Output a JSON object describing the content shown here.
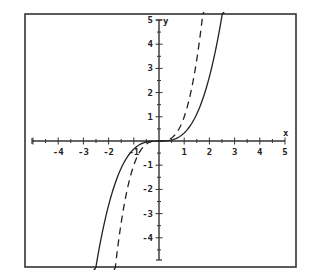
{
  "chart_data": {
    "type": "line",
    "title": "",
    "xlabel": "x",
    "ylabel": "y",
    "xlim": [
      -5,
      5
    ],
    "ylim": [
      -5,
      5
    ],
    "grid": false,
    "legend": null,
    "x_ticks": [
      -4,
      -3,
      -2,
      -1,
      1,
      2,
      3,
      4,
      5
    ],
    "x_tick_labels": [
      "-4",
      "-3",
      "-2",
      "-1",
      "1",
      "2",
      "3",
      "4",
      "5"
    ],
    "y_ticks": [
      -4,
      -3,
      -2,
      -1,
      1,
      2,
      3,
      4,
      5
    ],
    "y_tick_labels": [
      "-4",
      "-3",
      "-2",
      "-1",
      "1",
      "2",
      "3",
      "4",
      "5"
    ],
    "minor_tick_step": 0.5,
    "series": [
      {
        "name": "solid",
        "style": "solid",
        "color": "#222222",
        "expression": "y = x^3 / 3",
        "x": [
          -2.47,
          -2,
          -1.5,
          -1,
          -0.5,
          0,
          0.5,
          1,
          1.5,
          2,
          2.47
        ],
        "values": [
          -5.0,
          -2.67,
          -1.13,
          -0.33,
          -0.04,
          0,
          0.04,
          0.33,
          1.13,
          2.67,
          5.0
        ]
      },
      {
        "name": "dashed",
        "style": "dashed",
        "color": "#222222",
        "expression": "y = x^3",
        "x": [
          -1.71,
          -1.5,
          -1,
          -0.5,
          0,
          0.5,
          1,
          1.5,
          1.71
        ],
        "values": [
          -5.0,
          -3.38,
          -1.0,
          -0.13,
          0,
          0.13,
          1.0,
          3.38,
          5.0
        ]
      }
    ]
  },
  "axes": {
    "x_label": "x",
    "y_label": "y"
  }
}
